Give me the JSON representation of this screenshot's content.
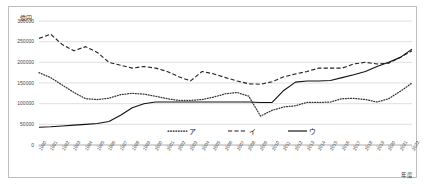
{
  "figure": {
    "unit_label": "億円",
    "xaxis_title": "年度"
  },
  "chart_data": {
    "type": "line",
    "title": "",
    "subtitle": "",
    "xlabel": "年度",
    "ylabel": "億円",
    "unit": "億円",
    "ylim": [
      0,
      300000
    ],
    "ytick_values": [
      0,
      50000,
      100000,
      150000,
      200000,
      250000,
      300000
    ],
    "ytick_labels": [
      "0",
      "50000",
      "100000",
      "150000",
      "200000",
      "250000",
      "300000"
    ],
    "grid": true,
    "grid_axis": "y",
    "legend_position": "bottom-center-inside",
    "categories": [
      "1990",
      "1991",
      "1992",
      "1993",
      "1994",
      "1995",
      "1996",
      "1997",
      "1998",
      "1999",
      "2000",
      "2001",
      "2002",
      "2003",
      "2004",
      "2005",
      "2006",
      "2007",
      "2008",
      "2009",
      "2010",
      "2011",
      "2012",
      "2013",
      "2014",
      "2015",
      "2016",
      "2017",
      "2018",
      "2019",
      "2020",
      "2021",
      "2022"
    ],
    "series": [
      {
        "name": "ア",
        "style": "dotted",
        "color": "#333333",
        "values": [
          175000,
          163000,
          145000,
          127000,
          112000,
          110000,
          113000,
          122000,
          125000,
          123000,
          118000,
          112000,
          108000,
          108000,
          110000,
          116000,
          124000,
          127000,
          118000,
          70000,
          84000,
          92000,
          95000,
          103000,
          103000,
          104000,
          112000,
          113000,
          110000,
          104000,
          112000,
          130000,
          150000
        ]
      },
      {
        "name": "イ",
        "style": "dashed",
        "color": "#222222",
        "values": [
          258000,
          268000,
          243000,
          228000,
          238000,
          224000,
          200000,
          193000,
          186000,
          190000,
          186000,
          178000,
          165000,
          155000,
          178000,
          172000,
          163000,
          155000,
          148000,
          147000,
          153000,
          165000,
          172000,
          178000,
          186000,
          186000,
          186000,
          196000,
          200000,
          196000,
          198000,
          212000,
          228000
        ]
      },
      {
        "name": "ウ",
        "style": "solid",
        "color": "#111111",
        "values": [
          43000,
          44000,
          46000,
          48000,
          50000,
          52000,
          57000,
          72000,
          90000,
          100000,
          104000,
          104000,
          104000,
          104000,
          104000,
          104000,
          104000,
          104000,
          104000,
          103000,
          103000,
          132000,
          152000,
          155000,
          155000,
          156000,
          163000,
          170000,
          178000,
          190000,
          200000,
          212000,
          232000
        ]
      }
    ],
    "legend": [
      {
        "label": "ア",
        "style": "dotted"
      },
      {
        "label": "イ",
        "style": "dashed"
      },
      {
        "label": "ウ",
        "style": "solid"
      }
    ]
  }
}
